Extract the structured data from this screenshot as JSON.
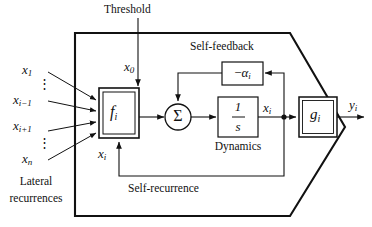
{
  "diagram": {
    "title_hidden": "",
    "labels": {
      "threshold": "Threshold",
      "self_feedback": "Self-feedback",
      "self_recurrence": "Self-recurrence",
      "dynamics": "Dynamics",
      "lateral_line1": "Lateral",
      "lateral_line2": "recurrences"
    },
    "inputs": [
      {
        "name": "x-1",
        "base": "x",
        "sub": "1"
      },
      {
        "name": "vdots-upper",
        "glyph": "⋮"
      },
      {
        "name": "x-i-minus-1",
        "base": "x",
        "sub": "i−1"
      },
      {
        "name": "x-i-plus-1",
        "base": "x",
        "sub": "i+1"
      },
      {
        "name": "vdots-lower",
        "glyph": "⋮"
      },
      {
        "name": "x-n",
        "base": "x",
        "sub": "n"
      }
    ],
    "signals": {
      "threshold_input": {
        "base": "x",
        "sub": "0"
      },
      "recurrent_input": {
        "base": "x",
        "sub": "i"
      },
      "state": {
        "base": "x",
        "sub": "i"
      },
      "output": {
        "base": "y",
        "sub": "i"
      }
    },
    "blocks": {
      "activation": {
        "base": "f",
        "sub": "i",
        "style": "double-border"
      },
      "summation": {
        "glyph": "Σ",
        "shape": "circle"
      },
      "integrator": {
        "numerator": "1",
        "denominator": "s",
        "shape": "rect"
      },
      "feedback_gain": {
        "op": "−",
        "base": "α",
        "sub": "i",
        "shape": "rect"
      },
      "output_fn": {
        "base": "g",
        "sub": "i",
        "style": "double-border"
      }
    },
    "colors": {
      "ink": "#111111",
      "line": "#222222",
      "background": "#ffffff"
    }
  }
}
